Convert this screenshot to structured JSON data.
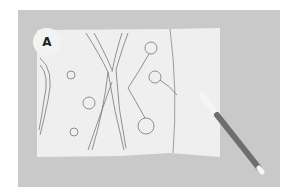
{
  "photo": {
    "badge_label": "A",
    "background_color": "#c9c9c9",
    "paper_color": "#efefef",
    "marker": {
      "cap_color": "#f5f5f5",
      "body_color": "#6e6e6e"
    }
  }
}
